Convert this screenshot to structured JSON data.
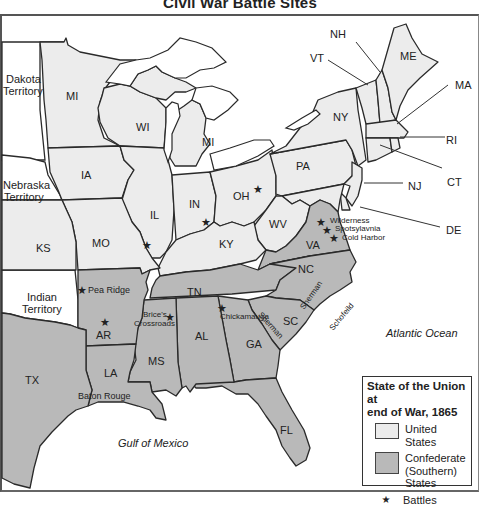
{
  "title": "Civil War Battle Sites",
  "colors": {
    "united_states": "#ececec",
    "confederate": "#b9b9b9",
    "territory": "#ffffff",
    "outline": "#2a2a2a"
  },
  "states": {
    "union": [
      "MI_MN",
      "WI",
      "MI",
      "IA",
      "IL",
      "IN",
      "OH",
      "PA",
      "NY",
      "VT",
      "NH",
      "ME",
      "MA",
      "RI",
      "CT",
      "NJ",
      "DE",
      "MO",
      "KY",
      "WV",
      "KS"
    ],
    "confederate": [
      "VA",
      "NC",
      "SC",
      "GA",
      "FL",
      "AL",
      "MS",
      "LA",
      "TN",
      "AR",
      "TX"
    ],
    "territories": [
      "Dakota Territory",
      "Nebraska Territory",
      "Indian Territory"
    ]
  },
  "labels": {
    "dakota": [
      "Dakota",
      "Territory"
    ],
    "nebraska": [
      "Nebraska",
      "Territory"
    ],
    "indian": [
      "Indian",
      "Territory"
    ],
    "mn": "MI",
    "wi": "WI",
    "mi": "MI",
    "ia": "IA",
    "il": "IL",
    "in": "IN",
    "oh": "OH",
    "pa": "PA",
    "ny": "NY",
    "vt": "VT",
    "nh": "NH",
    "me": "ME",
    "ma": "MA",
    "ri": "RI",
    "ct": "CT",
    "nj": "NJ",
    "de": "DE",
    "wv": "WV",
    "ky": "KY",
    "ks": "KS",
    "mo": "MO",
    "va": "VA",
    "nc": "NC",
    "tn": "TN",
    "sc": "SC",
    "ga": "GA",
    "al": "AL",
    "ms": "MS",
    "ar": "AR",
    "la": "LA",
    "tx": "TX",
    "fl": "FL"
  },
  "battles": [
    {
      "name": "Pea Ridge",
      "x": 82,
      "y": 290
    },
    {
      "name": "",
      "x": 105,
      "y": 322
    },
    {
      "name": "Brice's Crossroads",
      "x": 170,
      "y": 317
    },
    {
      "name": "Chickamauga",
      "x": 222,
      "y": 308
    },
    {
      "name": "Wilderness",
      "x": 321,
      "y": 222
    },
    {
      "name": "Spotsylavnia",
      "x": 327,
      "y": 230
    },
    {
      "name": "Cold Harbor",
      "x": 334,
      "y": 238
    },
    {
      "name": "",
      "x": 147,
      "y": 245
    },
    {
      "name": "",
      "x": 206,
      "y": 222
    },
    {
      "name": "",
      "x": 258,
      "y": 189
    }
  ],
  "annotations": {
    "brice_line1": "Brice's",
    "brice_line2": "Crossroads",
    "sherman_nc": "Sherman",
    "sherman_ga": "Sherman",
    "schofield": "Schofeild",
    "baton_rouge": "Baton Rouge"
  },
  "water": {
    "atlantic": "Atlantic Ocean",
    "gulf": "Gulf of Mexico"
  },
  "legend": {
    "title_line1": "State of the Union at",
    "title_line2": "end of War, 1865",
    "items": [
      {
        "label": "United States",
        "type": "swatch",
        "color": "#ececec"
      },
      {
        "label_lines": [
          "Confederate",
          "(Southern)",
          "States"
        ],
        "type": "swatch",
        "color": "#b9b9b9"
      },
      {
        "label": "Battles",
        "type": "star-icon"
      }
    ]
  }
}
